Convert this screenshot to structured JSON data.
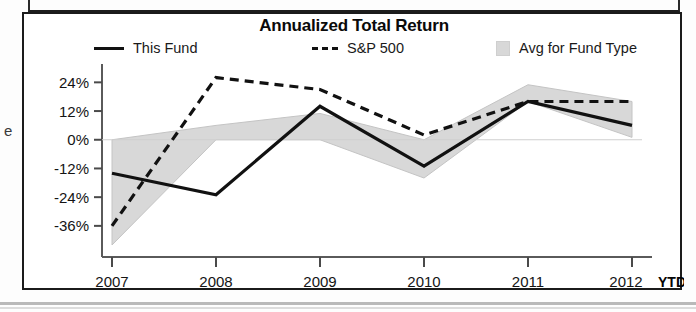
{
  "chart_data": {
    "type": "line",
    "title": "Annualized Total Return",
    "xlabel": "",
    "ylabel": "",
    "categories": [
      "2007",
      "2008",
      "2009",
      "2010",
      "2011",
      "2012"
    ],
    "last_category_note": "YTD",
    "ylim": [
      -44,
      30
    ],
    "yticks": [
      24,
      12,
      0,
      -12,
      -24,
      -36
    ],
    "ytick_labels": [
      "24%",
      "12%",
      "0%",
      "-12%",
      "-24%",
      "-36%"
    ],
    "grid": false,
    "legend_position": "top",
    "zero_line": 0,
    "series": [
      {
        "name": "This Fund",
        "style": "solid",
        "color": "#111111",
        "values": [
          -14,
          -23,
          14,
          -11,
          16,
          6
        ]
      },
      {
        "name": "S&P 500",
        "style": "dashed",
        "color": "#111111",
        "values": [
          -36,
          26,
          21,
          2,
          16,
          16
        ]
      },
      {
        "name": "Avg for Fund Type",
        "style": "band",
        "color": "#d8d8d8",
        "upper": [
          0,
          6,
          11,
          0,
          23,
          16
        ],
        "lower": [
          -44,
          0,
          0,
          -16,
          16,
          1
        ]
      }
    ]
  },
  "chart": {
    "title": "Annualized Total Return",
    "legend": [
      {
        "label": "This Fund",
        "marker": "solid-line-swatch"
      },
      {
        "label": "S&P 500",
        "marker": "dashed-line-swatch"
      },
      {
        "label": "Avg for Fund Type",
        "marker": "shaded-box-swatch"
      }
    ],
    "y_axis_labels": [
      "24%",
      "12%",
      "0%",
      "-12%",
      "-24%",
      "-36%"
    ],
    "x_axis_labels": [
      "2007",
      "2008",
      "2009",
      "2010",
      "2011",
      "2012"
    ],
    "ytd_label": "YTD"
  },
  "colors": {
    "line": "#111111",
    "band": "#d8d8d8",
    "axis": "#555555",
    "text": "#141414",
    "border": "#1b1b1b"
  }
}
